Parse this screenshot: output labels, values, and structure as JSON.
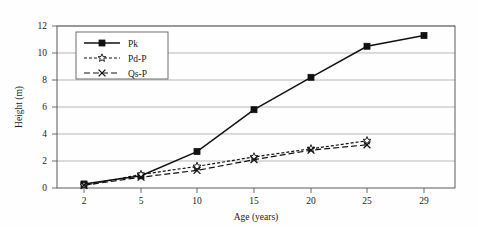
{
  "chart_data": {
    "type": "line",
    "title": "",
    "xlabel": "Age (years)",
    "ylabel": "Height (m)",
    "x": [
      2,
      5,
      10,
      15,
      20,
      25,
      29
    ],
    "xtick_labels": [
      "2",
      "5",
      "10",
      "15",
      "20",
      "25",
      "29"
    ],
    "ytick_labels": [
      "0",
      "2",
      "4",
      "6",
      "8",
      "10",
      "12"
    ],
    "yticks": [
      0,
      2,
      4,
      6,
      8,
      10,
      12
    ],
    "ylim": [
      0,
      12
    ],
    "grid": "horizontal",
    "legend_position": "top-left-inside",
    "series": [
      {
        "name": "Pk",
        "marker": "filled-square",
        "linestyle": "solid",
        "color": "#111111",
        "x": [
          2,
          5,
          10,
          15,
          20,
          25,
          29
        ],
        "values": [
          0.3,
          0.9,
          2.7,
          5.8,
          8.2,
          10.5,
          11.3
        ]
      },
      {
        "name": "Pd-P",
        "marker": "open-star",
        "linestyle": "dashed",
        "color": "#111111",
        "x": [
          2,
          5,
          10,
          15,
          20,
          25
        ],
        "values": [
          0.2,
          1.0,
          1.6,
          2.3,
          2.9,
          3.5
        ]
      },
      {
        "name": "Qs-P",
        "marker": "cross-x",
        "linestyle": "long-dash",
        "color": "#111111",
        "x": [
          2,
          5,
          10,
          15,
          20,
          25
        ],
        "values": [
          0.2,
          0.8,
          1.3,
          2.1,
          2.8,
          3.2
        ]
      }
    ]
  },
  "legend": {
    "items": [
      {
        "label": "Pk"
      },
      {
        "label": "Pd-P"
      },
      {
        "label": "Qs-P"
      }
    ]
  },
  "axes": {
    "x_title": "Age (years)",
    "y_title": "Height (m)"
  }
}
